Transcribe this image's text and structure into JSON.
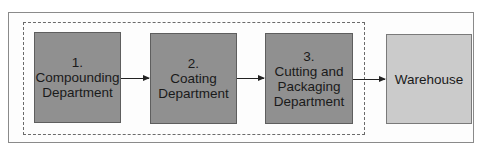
{
  "diagram": {
    "nodes": [
      {
        "id": "compounding",
        "number": "1.",
        "label": "1.\nCompounding\nDepartment"
      },
      {
        "id": "coating",
        "number": "2.",
        "label": "2.\nCoating\nDepartment"
      },
      {
        "id": "cutting",
        "number": "3.",
        "label": "3.\nCutting and\nPackaging\nDepartment"
      },
      {
        "id": "warehouse",
        "label": "Warehouse"
      }
    ],
    "edges": [
      {
        "from": "compounding",
        "to": "coating"
      },
      {
        "from": "coating",
        "to": "cutting"
      },
      {
        "from": "cutting",
        "to": "warehouse"
      }
    ],
    "colors": {
      "department_fill": "#909090",
      "warehouse_fill": "#cbcbcb",
      "outline": "#5e5e5e"
    }
  }
}
